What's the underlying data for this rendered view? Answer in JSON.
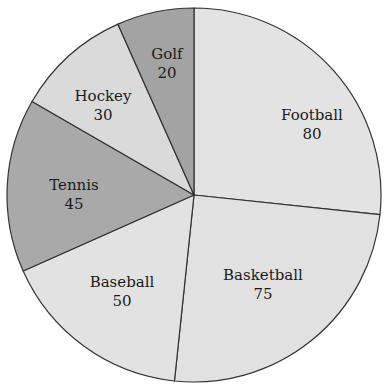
{
  "chart_data": {
    "type": "pie",
    "title": "",
    "start_angle_deg": 0,
    "direction": "clockwise",
    "categories": [
      "Football",
      "Basketball",
      "Baseball",
      "Tennis",
      "Hockey",
      "Golf"
    ],
    "values": [
      80,
      75,
      50,
      45,
      30,
      20
    ],
    "colors": [
      "#e3e3e3",
      "#e1e1e1",
      "#e2e2e2",
      "#a9a9a9",
      "#dadada",
      "#a3a3a3"
    ],
    "labels": [
      {
        "name": "Football",
        "value": "80"
      },
      {
        "name": "Basketball",
        "value": "75"
      },
      {
        "name": "Baseball",
        "value": "50"
      },
      {
        "name": "Tennis",
        "value": "45"
      },
      {
        "name": "Hockey",
        "value": "30"
      },
      {
        "name": "Golf",
        "value": "20"
      }
    ],
    "legend": "none",
    "label_position": "inside"
  },
  "geometry": {
    "cx": 194,
    "cy": 195,
    "r": 187
  },
  "label_positions": [
    {
      "x": 312,
      "y": 120
    },
    {
      "x": 263,
      "y": 280
    },
    {
      "x": 122,
      "y": 287
    },
    {
      "x": 74,
      "y": 190
    },
    {
      "x": 103,
      "y": 101
    },
    {
      "x": 167,
      "y": 59
    }
  ],
  "stroke_color": "#333333"
}
